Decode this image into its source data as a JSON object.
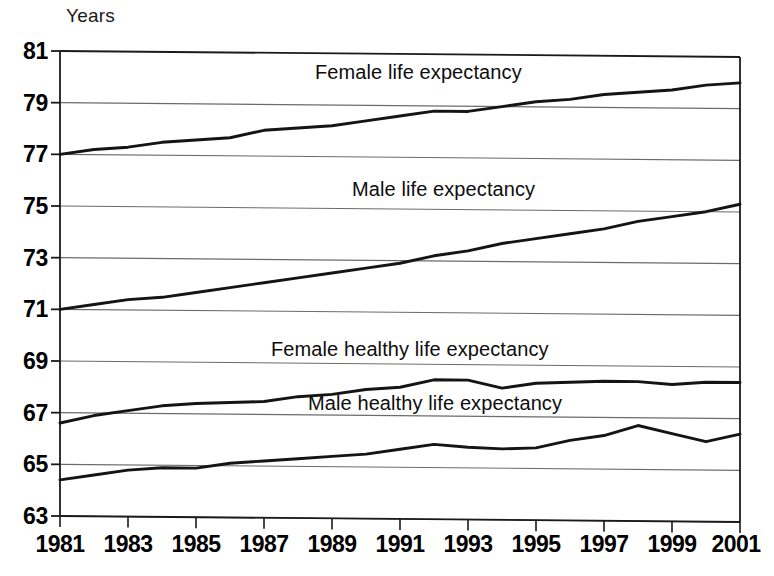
{
  "chart_data": {
    "type": "line",
    "title": "",
    "xlabel": "",
    "ylabel": "Years",
    "ylim": [
      63,
      81
    ],
    "xlim": [
      1981,
      2001
    ],
    "grid": true,
    "legend_position": "inline-annotations",
    "y_ticks": [
      63,
      65,
      67,
      69,
      71,
      73,
      75,
      77,
      79,
      81
    ],
    "x_ticks": [
      1981,
      1983,
      1985,
      1987,
      1989,
      1991,
      1993,
      1995,
      1997,
      1999,
      2001
    ],
    "x": [
      1981,
      1982,
      1983,
      1984,
      1985,
      1986,
      1987,
      1988,
      1989,
      1990,
      1991,
      1992,
      1993,
      1994,
      1995,
      1996,
      1997,
      1998,
      1999,
      2000,
      2001
    ],
    "series": [
      {
        "name": "Female life expectancy",
        "values": [
          77.0,
          77.2,
          77.3,
          77.5,
          77.6,
          77.7,
          78.0,
          78.1,
          78.2,
          78.4,
          78.6,
          78.8,
          78.8,
          79.0,
          79.2,
          79.3,
          79.5,
          79.6,
          79.7,
          79.9,
          80.0
        ]
      },
      {
        "name": "Male life expectancy",
        "values": [
          71.0,
          71.2,
          71.4,
          71.5,
          71.7,
          71.9,
          72.1,
          72.3,
          72.5,
          72.7,
          72.9,
          73.2,
          73.4,
          73.7,
          73.9,
          74.1,
          74.3,
          74.6,
          74.8,
          75.0,
          75.3
        ]
      },
      {
        "name": "Female healthy life expectancy",
        "values": [
          66.6,
          66.9,
          67.1,
          67.3,
          67.4,
          67.45,
          67.5,
          67.7,
          67.8,
          68.0,
          68.1,
          68.4,
          68.4,
          68.1,
          68.3,
          68.35,
          68.4,
          68.4,
          68.3,
          68.4,
          68.4
        ]
      },
      {
        "name": "Male healthy life expectancy",
        "values": [
          64.4,
          64.6,
          64.8,
          64.9,
          64.9,
          65.1,
          65.2,
          65.3,
          65.4,
          65.5,
          65.7,
          65.9,
          65.8,
          65.75,
          65.8,
          66.1,
          66.3,
          66.7,
          66.4,
          66.1,
          66.4
        ]
      }
    ],
    "annotations": [
      {
        "text": "Female life expectancy",
        "x": 1988.5,
        "y": 80.1
      },
      {
        "text": "Male life expectancy",
        "x": 1989.6,
        "y": 75.6
      },
      {
        "text": "Female healthy life expectancy",
        "x": 1987.2,
        "y": 69.4
      },
      {
        "text": "Male healthy life expectancy",
        "x": 1988.3,
        "y": 67.3
      }
    ],
    "colors": {
      "series_line": "#141414",
      "grid_line": "#6b6b6b",
      "axis_line": "#1a1a1a",
      "background": "#ffffff",
      "text": "#000000"
    }
  }
}
